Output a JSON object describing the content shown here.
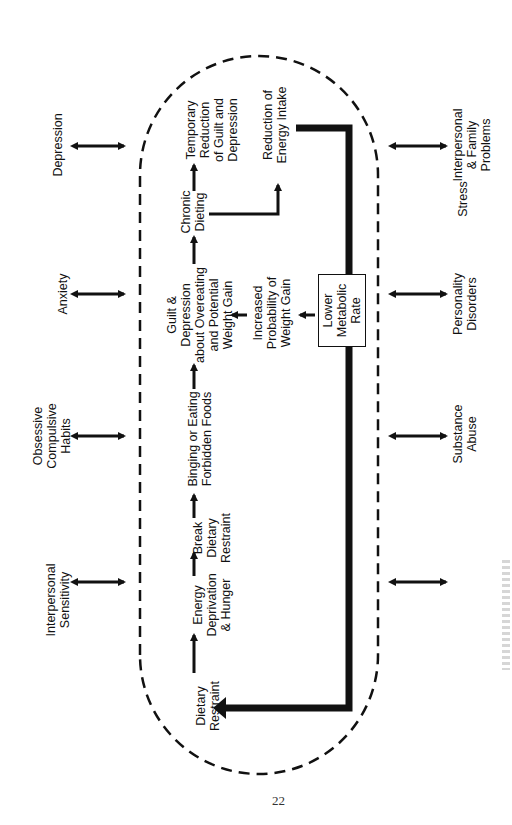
{
  "page_number": "22",
  "diagram": {
    "flow_main": [
      {
        "id": "dietary-restraint",
        "text": "Dietary\nRestraint"
      },
      {
        "id": "energy-deprivation",
        "text": "Energy\nDeprivation\n& Hunger"
      },
      {
        "id": "break-restraint",
        "text": "Break\nDietary\nRestraint"
      },
      {
        "id": "binging",
        "text": "Binging or Eating\nForbidden Foods"
      },
      {
        "id": "guilt",
        "text": "Guilt &\nDepression\nabout Overeating\nand Potential\nWeight Gain"
      },
      {
        "id": "chronic-dieting",
        "text": "Chronic\nDieting"
      },
      {
        "id": "temporary-reduction",
        "text": "Temporary\nReduction\nof Guilt and\nDepression"
      }
    ],
    "flow_secondary": [
      {
        "id": "reduction-energy",
        "text": "Reduction of\nEnergy Intake"
      },
      {
        "id": "increased-probability",
        "text": "Increased\nProbability of\nWeight Gain"
      },
      {
        "id": "lower-metabolic",
        "text": "Lower\nMetabolic\nRate"
      }
    ],
    "external_factors_top": [
      {
        "id": "depression",
        "text": "Depression"
      },
      {
        "id": "anxiety",
        "text": "Anxiety"
      },
      {
        "id": "obsessive",
        "text": "Obsessive\nCompulsive\nHabits"
      },
      {
        "id": "interpersonal-sensitivity",
        "text": "Interpersonal\nSensitivity"
      }
    ],
    "external_factors_bottom": [
      {
        "id": "interpersonal-family",
        "text": "Interpersonal\n& Family\nProblems"
      },
      {
        "id": "personality",
        "text": "Personality\nDisorders"
      },
      {
        "id": "substance",
        "text": "Substance\nAbuse"
      },
      {
        "id": "stress",
        "text": "Stress"
      }
    ]
  }
}
